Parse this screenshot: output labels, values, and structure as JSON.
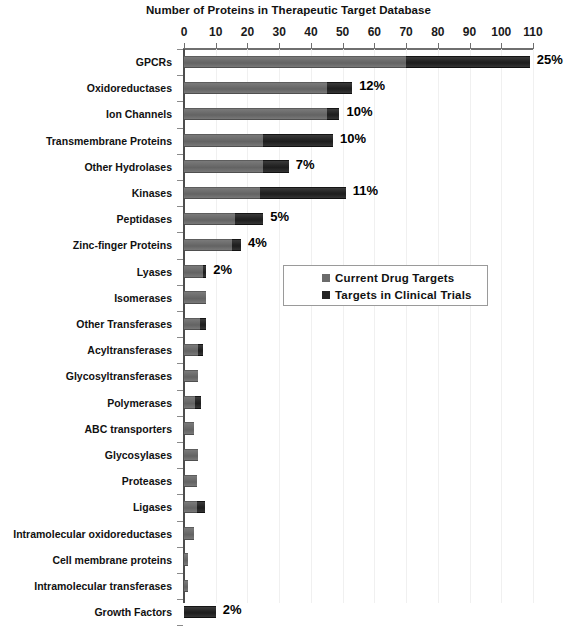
{
  "chart_data": {
    "type": "bar",
    "orientation": "horizontal",
    "stacked": true,
    "title": "Number of Proteins in Therapeutic Target Database",
    "xlabel": "",
    "ylabel": "",
    "xlim": [
      0,
      110
    ],
    "xticks": [
      0,
      10,
      20,
      30,
      40,
      50,
      60,
      70,
      80,
      90,
      100,
      110
    ],
    "grid": true,
    "legend_position": "middle-right",
    "legend": [
      "Current Drug Targets",
      "Targets in Clinical Trials"
    ],
    "categories": [
      "GPCRs",
      "Oxidoreductases",
      "Ion Channels",
      "Transmembrane Proteins",
      "Other Hydrolases",
      "Kinases",
      "Peptidases",
      "Zinc-finger Proteins",
      "Lyases",
      "Isomerases",
      "Other Transferases",
      "Acyltransferases",
      "Glycosyltransferases",
      "Polymerases",
      "ABC transporters",
      "Glycosylases",
      "Proteases",
      "Ligases",
      "Intramolecular oxidoreductases",
      "Cell membrane proteins",
      "Intramolecular transferases",
      "Growth Factors"
    ],
    "series": [
      {
        "name": "Current Drug Targets",
        "color": "#6b6b6b",
        "values": [
          70,
          45,
          45,
          25,
          25,
          24,
          16,
          15,
          6,
          7,
          5,
          4.5,
          4.5,
          3.5,
          3,
          4.5,
          4,
          4,
          3,
          1.3,
          1.3,
          0
        ]
      },
      {
        "name": "Targets in Clinical Trials",
        "color": "#242424",
        "values": [
          39,
          8,
          4,
          22,
          8,
          27,
          9,
          3,
          1,
          0,
          2,
          1.5,
          0,
          2,
          0,
          0,
          0,
          2.5,
          0,
          0,
          0,
          10
        ]
      }
    ],
    "data_labels": [
      "25%",
      "12%",
      "10%",
      "10%",
      "7%",
      "11%",
      "5%",
      "4%",
      "2%",
      "",
      "",
      "",
      "",
      "",
      "",
      "",
      "",
      "",
      "",
      "",
      "",
      "2%"
    ]
  },
  "colors": {
    "series_light": "#6b6b6b",
    "series_dark": "#242424",
    "axis": "#4d4d4d",
    "grid": "#f0f0f0",
    "text": "#111111",
    "background": "#ffffff"
  }
}
